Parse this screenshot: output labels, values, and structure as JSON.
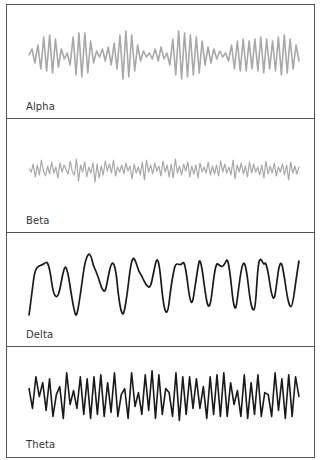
{
  "figure": {
    "border_color": "#555555"
  },
  "chart_data": [
    {
      "type": "line",
      "title": "Alpha",
      "label": "Alpha",
      "stroke": "#a8a8a8",
      "stroke_width": 1.6,
      "grid": false,
      "axes": false,
      "description": "Rhythmic medium-frequency oscillation with waxing/waning amplitude (spindles)",
      "baseline_y": 50,
      "ylim": [
        -30,
        30
      ],
      "y": [
        0,
        -6,
        8,
        -10,
        14,
        -18,
        16,
        -20,
        18,
        -16,
        12,
        -6,
        4,
        -2,
        10,
        -18,
        20,
        -22,
        22,
        -22,
        18,
        -14,
        8,
        -4,
        2,
        -6,
        6,
        -8,
        10,
        -12,
        14,
        -20,
        24,
        -24,
        22,
        -20,
        16,
        -10,
        6,
        -4,
        2,
        -2,
        4,
        -6,
        6,
        -8,
        4,
        -2,
        10,
        -16,
        20,
        -24,
        24,
        -22,
        22,
        -20,
        20,
        -18,
        18,
        -14,
        10,
        -8,
        8,
        -6,
        4,
        -4,
        2,
        -2,
        6,
        -10,
        14,
        -14,
        16,
        -16,
        16,
        -14,
        14,
        -16,
        16,
        -18,
        18,
        -16,
        14,
        -14,
        16,
        -18,
        20,
        -20,
        18,
        -16,
        14,
        -10,
        6
      ]
    },
    {
      "type": "line",
      "title": "Beta",
      "label": "Beta",
      "stroke": "#a8a8a8",
      "stroke_width": 1.2,
      "grid": false,
      "axes": false,
      "description": "Low-amplitude, high-frequency irregular activity",
      "baseline_y": 50,
      "ylim": [
        -20,
        20
      ],
      "y": [
        0,
        3,
        -5,
        8,
        -4,
        6,
        -9,
        2,
        7,
        -3,
        5,
        -7,
        4,
        -2,
        9,
        -6,
        3,
        -4,
        1,
        5,
        -8,
        3,
        6,
        -10,
        12,
        -4,
        3,
        -7,
        8,
        -2,
        4,
        -6,
        13,
        -5,
        9,
        -3,
        6,
        -8,
        2,
        -5,
        4,
        -9,
        7,
        -2,
        3,
        -4,
        5,
        -6,
        2,
        -3,
        10,
        -5,
        4,
        -2,
        6,
        -7,
        11,
        -9,
        3,
        -4,
        5,
        -6,
        2,
        -3,
        7,
        -8,
        3,
        -4,
        8,
        -5,
        9,
        -10,
        4,
        -3,
        6,
        -5,
        2,
        -7,
        8,
        -3,
        5,
        -4,
        9,
        -6,
        3,
        -2,
        4,
        -7,
        6,
        -3,
        5,
        -4,
        7,
        -8,
        3,
        -5,
        4,
        -2,
        6,
        -9,
        10,
        -4,
        3,
        -6,
        5,
        -3,
        8,
        -7,
        4,
        -5,
        3,
        -2,
        6,
        -4,
        9,
        -8,
        5,
        -3,
        4,
        -6,
        7,
        -2,
        3,
        -5,
        6,
        -4,
        11,
        -7,
        4,
        -3,
        5,
        -2
      ]
    },
    {
      "type": "line",
      "title": "Delta",
      "label": "Delta",
      "stroke": "#1a1a1a",
      "stroke_width": 1.7,
      "grid": false,
      "axes": false,
      "description": "High-amplitude, slow waves",
      "baseline_y": 50,
      "ylim": [
        -35,
        35
      ],
      "points": [
        [
          0,
          32
        ],
        [
          3,
          10
        ],
        [
          6,
          -12
        ],
        [
          10,
          -17
        ],
        [
          14,
          -18
        ],
        [
          17,
          -20
        ],
        [
          20,
          -21
        ],
        [
          23,
          -10
        ],
        [
          26,
          10
        ],
        [
          30,
          15
        ],
        [
          33,
          8
        ],
        [
          36,
          -8
        ],
        [
          39,
          -18
        ],
        [
          42,
          -10
        ],
        [
          45,
          8
        ],
        [
          48,
          25
        ],
        [
          51,
          35
        ],
        [
          54,
          20
        ],
        [
          57,
          0
        ],
        [
          60,
          -20
        ],
        [
          64,
          -30
        ],
        [
          67,
          -27
        ],
        [
          69,
          -18
        ],
        [
          72,
          -12
        ],
        [
          75,
          -5
        ],
        [
          78,
          5
        ],
        [
          82,
          10
        ],
        [
          85,
          -5
        ],
        [
          88,
          -18
        ],
        [
          91,
          -21
        ],
        [
          94,
          -10
        ],
        [
          96,
          10
        ],
        [
          99,
          28
        ],
        [
          102,
          33
        ],
        [
          106,
          10
        ],
        [
          109,
          -15
        ],
        [
          112,
          -26
        ],
        [
          115,
          -22
        ],
        [
          118,
          -12
        ],
        [
          121,
          -8
        ],
        [
          124,
          -2
        ],
        [
          127,
          3
        ],
        [
          131,
          5
        ],
        [
          135,
          -14
        ],
        [
          138,
          -26
        ],
        [
          141,
          -15
        ],
        [
          144,
          15
        ],
        [
          147,
          30
        ],
        [
          150,
          28
        ],
        [
          153,
          4
        ],
        [
          156,
          -12
        ],
        [
          158,
          -19
        ],
        [
          161,
          -19
        ],
        [
          164,
          -18
        ],
        [
          167,
          -22
        ],
        [
          170,
          -8
        ],
        [
          173,
          15
        ],
        [
          176,
          22
        ],
        [
          179,
          3
        ],
        [
          182,
          -15
        ],
        [
          184,
          -25
        ],
        [
          187,
          -12
        ],
        [
          190,
          10
        ],
        [
          193,
          25
        ],
        [
          196,
          20
        ],
        [
          199,
          -5
        ],
        [
          202,
          -20
        ],
        [
          205,
          -18
        ],
        [
          208,
          -16
        ],
        [
          211,
          -19
        ],
        [
          214,
          -25
        ],
        [
          217,
          -8
        ],
        [
          220,
          20
        ],
        [
          223,
          28
        ],
        [
          226,
          5
        ],
        [
          229,
          -15
        ],
        [
          232,
          -22
        ],
        [
          235,
          -10
        ],
        [
          238,
          15
        ],
        [
          241,
          28
        ],
        [
          244,
          25
        ],
        [
          247,
          -20
        ],
        [
          250,
          -25
        ],
        [
          253,
          -18
        ],
        [
          255,
          -21
        ],
        [
          258,
          -10
        ],
        [
          261,
          10
        ],
        [
          264,
          17
        ],
        [
          266,
          8
        ],
        [
          269,
          -15
        ],
        [
          272,
          -22
        ],
        [
          275,
          -8
        ],
        [
          278,
          12
        ],
        [
          281,
          24
        ],
        [
          284,
          23
        ],
        [
          288,
          -4
        ],
        [
          291,
          -22
        ]
      ]
    },
    {
      "type": "line",
      "title": "Theta",
      "label": "Theta",
      "stroke": "#1a1a1a",
      "stroke_width": 1.6,
      "grid": false,
      "axes": false,
      "description": "Medium-high amplitude rhythmic waves at moderate frequency",
      "baseline_y": 50,
      "ylim": [
        -30,
        30
      ],
      "y": [
        -8,
        12,
        -20,
        0,
        -14,
        14,
        -18,
        20,
        -2,
        -10,
        22,
        -24,
        8,
        -6,
        12,
        -20,
        18,
        -18,
        22,
        -20,
        18,
        -22,
        20,
        -14,
        16,
        -24,
        20,
        -2,
        -8,
        22,
        -24,
        10,
        -4,
        18,
        -22,
        14,
        -26,
        22,
        -22,
        18,
        -8,
        -4,
        20,
        -24,
        24,
        -20,
        18,
        -20,
        12,
        -18,
        12,
        -10,
        22,
        -20,
        18,
        -22,
        20,
        -24,
        20,
        -14,
        8,
        -6,
        20,
        -22,
        22,
        -14,
        18,
        -22,
        20,
        -4,
        -2,
        20,
        -24,
        14,
        -18,
        22,
        -22,
        20,
        -20,
        0
      ]
    }
  ]
}
